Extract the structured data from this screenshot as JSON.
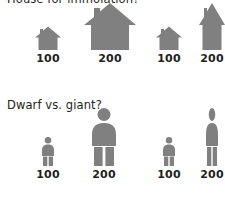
{
  "sections": [
    {
      "id": "houses",
      "title": "House for immolation?",
      "panels": [
        {
          "id": "house-proportional",
          "scaling": "proportional",
          "items": [
            {
              "label": "100",
              "icon": "house-icon",
              "width": 26,
              "height": 26
            },
            {
              "label": "200",
              "icon": "house-icon",
              "width": 52,
              "height": 52
            }
          ]
        },
        {
          "id": "house-stretched",
          "scaling": "height-only",
          "items": [
            {
              "label": "100",
              "icon": "house-icon",
              "width": 26,
              "height": 26
            },
            {
              "label": "200",
              "icon": "house-icon",
              "width": 26,
              "height": 52
            }
          ]
        }
      ]
    },
    {
      "id": "people",
      "title": "Dwarf vs. giant?",
      "panels": [
        {
          "id": "person-proportional",
          "scaling": "proportional",
          "items": [
            {
              "label": "100",
              "icon": "person-icon",
              "width": 14,
              "height": 29
            },
            {
              "label": "200",
              "icon": "person-icon",
              "width": 28,
              "height": 58
            }
          ]
        },
        {
          "id": "person-stretched",
          "scaling": "height-only",
          "items": [
            {
              "label": "100",
              "icon": "person-icon",
              "width": 14,
              "height": 29
            },
            {
              "label": "200",
              "icon": "person-icon",
              "width": 14,
              "height": 58
            }
          ]
        }
      ]
    }
  ],
  "colors": {
    "icon_gray": "#808080",
    "label_text": "#231f20",
    "background": "#ffffff"
  }
}
